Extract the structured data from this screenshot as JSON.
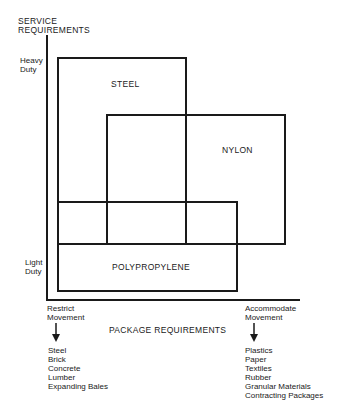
{
  "y_axis": {
    "title_line1": "SERVICE",
    "title_line2": "REQUIREMENTS",
    "top_label_line1": "Heavy",
    "top_label_line2": "Duty",
    "bottom_label_line1": "Light",
    "bottom_label_line2": "Duty"
  },
  "x_axis": {
    "title": "PACKAGE REQUIREMENTS",
    "left": {
      "label_line1": "Restrict",
      "label_line2": "Movement",
      "items": [
        "Steel",
        "Brick",
        "Concrete",
        "Lumber",
        "Expanding Bales"
      ]
    },
    "right": {
      "label_line1": "Accommodate",
      "label_line2": "Movement",
      "items": [
        "Plastics",
        "Paper",
        "Textiles",
        "Rubber",
        "Granular Materials",
        "Contracting Packages"
      ]
    }
  },
  "regions": {
    "steel": "STEEL",
    "nylon": "NYLON",
    "polypropylene": "POLYPROPYLENE"
  },
  "colors": {
    "ink": "#1a1a1a",
    "background": "#ffffff"
  }
}
